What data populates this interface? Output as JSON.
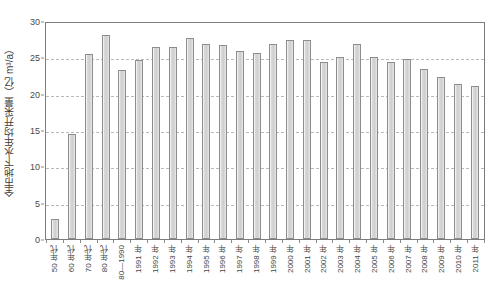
{
  "chart_data": {
    "type": "bar",
    "title": "",
    "xlabel": "",
    "ylabel": "全市地下水年均开采量（亿 m³/a）",
    "ylim": [
      0,
      30
    ],
    "ytick_labels": [
      "30",
      "25",
      "20",
      "15",
      "10",
      "5",
      "0"
    ],
    "ytick_values": [
      30,
      25,
      20,
      15,
      10,
      5,
      0
    ],
    "grid": "horizontal-dashed",
    "legend": "none",
    "bar_color": "#d4d4d4",
    "bar_edge_color": "#8d8d8d",
    "grid_color": "#b9b9b9",
    "axis_color": "#7d7d7d",
    "categories": [
      "50 年代",
      "60 年代",
      "70 年代",
      "80 年代",
      "80—1990",
      "1991 年",
      "1992 年",
      "1993 年",
      "1994 年",
      "1995 年",
      "1996 年",
      "1997 年",
      "1998 年",
      "1999 年",
      "2000 年",
      "2001 年",
      "2002 年",
      "2003 年",
      "2004 年",
      "2005 年",
      "2006 年",
      "2007 年",
      "2008 年",
      "2009 年",
      "2010 年",
      "2011 年"
    ],
    "values": [
      2.8,
      14.5,
      25.4,
      28.1,
      23.2,
      24.6,
      26.4,
      26.4,
      27.7,
      26.9,
      26.7,
      25.9,
      25.6,
      26.9,
      27.4,
      27.4,
      24.3,
      25.0,
      26.9,
      25.1,
      24.4,
      24.8,
      23.4,
      22.3,
      21.4,
      21.0
    ]
  }
}
